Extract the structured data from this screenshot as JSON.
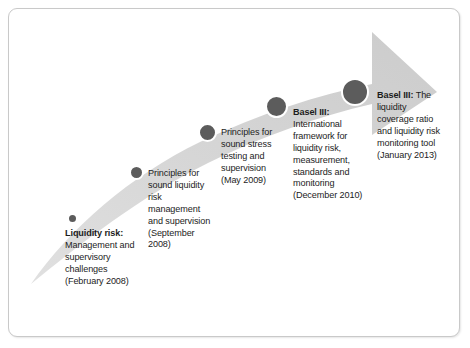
{
  "figure": {
    "type": "timeline-arrow-diagram",
    "border_color": "#c9c9c9",
    "background_color": "#ffffff",
    "arrow_color": "#d4d4d4",
    "dot_color": "#5c5c5c",
    "dot_ring_color": "#ffffff",
    "text_color": "#1c1c1c"
  },
  "milestones": [
    {
      "id": "liquidity-risk-2008",
      "lead": "Liquidity risk:",
      "body": "Management and supervisory challenges (February 2008)",
      "date": "February 2008",
      "dot": {
        "cx": 72,
        "cy": 218,
        "d": 7
      },
      "label": {
        "x": 65,
        "y": 228,
        "w": 70
      }
    },
    {
      "id": "principles-sound-liquidity-2008",
      "lead": "",
      "body": "Principles for sound liquidity risk management and supervision (September 2008)",
      "date": "September 2008",
      "dot": {
        "cx": 136,
        "cy": 172,
        "d": 11
      },
      "label": {
        "x": 148,
        "y": 168,
        "w": 66
      }
    },
    {
      "id": "principles-stress-testing-2009",
      "lead": "",
      "body": "Principles for sound stress testing and supervision (May 2009)",
      "date": "May 2009",
      "dot": {
        "cx": 207,
        "cy": 132,
        "d": 15
      },
      "label": {
        "x": 221,
        "y": 127,
        "w": 66
      }
    },
    {
      "id": "basel-iii-framework-2010",
      "lead": "Basel III:",
      "body": "International framework for liquidity risk, measurement, standards and monitoring (December 2010)",
      "date": "December 2010",
      "dot": {
        "cx": 276,
        "cy": 106,
        "d": 19
      },
      "label": {
        "x": 293,
        "y": 107,
        "w": 70
      }
    },
    {
      "id": "basel-iii-lcr-2013",
      "lead": "Basel III:",
      "body": "The liquidity coverage ratio and liquidity risk monitoring tool (January 2013)",
      "date": "January 2013",
      "dot": {
        "cx": 355,
        "cy": 92,
        "d": 24
      },
      "label": {
        "x": 377,
        "y": 90,
        "w": 66
      }
    }
  ]
}
